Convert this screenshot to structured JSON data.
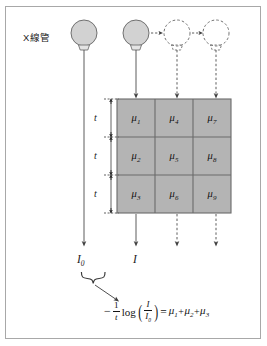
{
  "figure": {
    "title_label": "X線管",
    "background_color": "#ffffff",
    "frame_color": "#a8a8a8",
    "grid_fill_color": "#b4b4b4",
    "grid_line_color": "#6b6b6b",
    "tube_fill_color": "#d2d2d2",
    "tube_stroke_color": "#707070",
    "arrow_color": "#4a4a4a"
  },
  "tubes": [
    {
      "name": "tube-1",
      "style": "solid",
      "filled": true
    },
    {
      "name": "tube-2",
      "style": "solid",
      "filled": true
    },
    {
      "name": "tube-3",
      "style": "dashed",
      "filled": false
    },
    {
      "name": "tube-4",
      "style": "dashed",
      "filled": false
    }
  ],
  "thickness_labels": [
    {
      "label": "t"
    },
    {
      "label": "t"
    },
    {
      "label": "t"
    }
  ],
  "grid": {
    "rows": 3,
    "cols": 3,
    "cells": [
      [
        {
          "symbol": "μ",
          "sub": "1"
        },
        {
          "symbol": "μ",
          "sub": "4"
        },
        {
          "symbol": "μ",
          "sub": "7"
        }
      ],
      [
        {
          "symbol": "μ",
          "sub": "2"
        },
        {
          "symbol": "μ",
          "sub": "5"
        },
        {
          "symbol": "μ",
          "sub": "8"
        }
      ],
      [
        {
          "symbol": "μ",
          "sub": "3"
        },
        {
          "symbol": "μ",
          "sub": "6"
        },
        {
          "symbol": "μ",
          "sub": "9"
        }
      ]
    ]
  },
  "flux_labels": [
    {
      "symbol": "I",
      "sub": "0"
    },
    {
      "symbol": "I",
      "sub": ""
    }
  ],
  "formula": {
    "minus": "−",
    "frac_num": "1",
    "frac_den": "t",
    "fn": "log",
    "inner_num": "I",
    "inner_den_symbol": "I",
    "inner_den_sub": "0",
    "equals": "=",
    "terms": [
      {
        "symbol": "μ",
        "sub": "1"
      },
      {
        "symbol": "μ",
        "sub": "2"
      },
      {
        "symbol": "μ",
        "sub": "3"
      }
    ],
    "plus": "+",
    "full_text": "−(1/t)log(I/I₀) = μ₁+μ₂+μ₃"
  }
}
